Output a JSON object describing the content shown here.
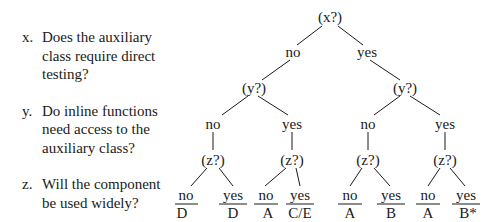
{
  "questions": [
    {
      "label": "x.",
      "lines": [
        "Does the auxiliary",
        "class require direct",
        "testing?"
      ]
    },
    {
      "label": "y.",
      "lines": [
        "Do inline functions",
        "need access to the",
        "auxiliary class?"
      ]
    },
    {
      "label": "z.",
      "lines": [
        "Will the component",
        "be used widely?"
      ]
    }
  ],
  "tree": {
    "root": "(x?)",
    "level1": [
      "no",
      "yes"
    ],
    "level2": [
      "(y?)",
      "(y?)"
    ],
    "level3": [
      "no",
      "yes",
      "no",
      "yes"
    ],
    "level4": [
      "(z?)",
      "(z?)",
      "(z?)",
      "(z?)"
    ],
    "answers": [
      "no",
      "yes",
      "no",
      "yes",
      "no",
      "yes",
      "no",
      "yes"
    ],
    "outcomes": [
      "D",
      "D",
      "A",
      "C/E",
      "A",
      "B",
      "A",
      "B*"
    ]
  }
}
